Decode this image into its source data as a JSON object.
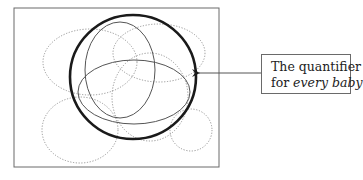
{
  "label": {
    "line1": "The quantifier",
    "line2_prefix": "for ",
    "line2_italic": "every baby"
  },
  "colors": {
    "frame": "#6a6a6a",
    "thick_circle": "#1a1a1a",
    "solid_ellipse": "#555555",
    "dotted_ellipse": "#8a8a8a",
    "arrow": "#555555"
  },
  "shapes": {
    "frame": {
      "x": 14,
      "y": 8,
      "w": 205,
      "h": 159
    },
    "quantifier_circle": {
      "cx": 133,
      "cy": 77,
      "rx": 63,
      "ry": 62
    },
    "solid_ellipses": [
      {
        "cx": 120,
        "cy": 70,
        "rx": 35,
        "ry": 48
      },
      {
        "cx": 134,
        "cy": 92,
        "rx": 56,
        "ry": 32
      }
    ],
    "dotted_ellipses": [
      {
        "cx": 90,
        "cy": 62,
        "rx": 47,
        "ry": 33
      },
      {
        "cx": 159,
        "cy": 53,
        "rx": 46,
        "ry": 29
      },
      {
        "cx": 150,
        "cy": 97,
        "rx": 38,
        "ry": 44
      },
      {
        "cx": 80,
        "cy": 130,
        "rx": 38,
        "ry": 33
      },
      {
        "cx": 191,
        "cy": 130,
        "rx": 21,
        "ry": 21
      }
    ],
    "arrow": {
      "x1": 261,
      "y1": 73,
      "x2": 198,
      "y2": 73
    }
  }
}
